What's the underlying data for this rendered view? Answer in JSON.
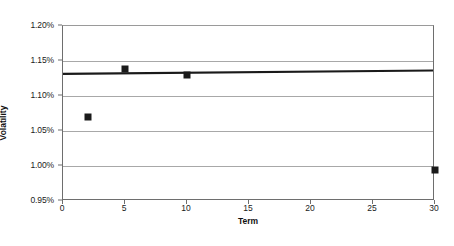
{
  "chart_data": {
    "type": "scatter",
    "title": "",
    "xlabel": "Term",
    "ylabel": "Volatility",
    "xlim": [
      0,
      30
    ],
    "ylim": [
      0.0095,
      0.012
    ],
    "grid": "horizontal",
    "legend": "none",
    "x_ticks": [
      0,
      5,
      10,
      15,
      20,
      25,
      30
    ],
    "x_tick_labels": [
      "0",
      "5",
      "10",
      "15",
      "20",
      "25",
      "30"
    ],
    "y_ticks": [
      0.0095,
      0.01,
      0.0105,
      0.011,
      0.0115,
      0.012
    ],
    "y_tick_labels": [
      "0.95%",
      "1.00%",
      "1.05%",
      "1.10%",
      "1.15%",
      "1.20%"
    ],
    "series": [
      {
        "name": "Volatility",
        "marker": "filled-square",
        "color": "#1a1a1a",
        "points": [
          {
            "x": 2,
            "y": 0.010707,
            "y_label": "1.071%"
          },
          {
            "x": 5,
            "y": 0.011386,
            "y_label": "1.139%"
          },
          {
            "x": 10,
            "y": 0.011307,
            "y_label": "1.131%"
          },
          {
            "x": 30,
            "y": 0.00995,
            "y_label": "0.995%"
          }
        ]
      },
      {
        "name": "Trendline",
        "type": "line",
        "color": "#1a1a1a",
        "points": [
          {
            "x": 0,
            "y": 0.011307
          },
          {
            "x": 30,
            "y": 0.011357
          }
        ]
      }
    ]
  }
}
